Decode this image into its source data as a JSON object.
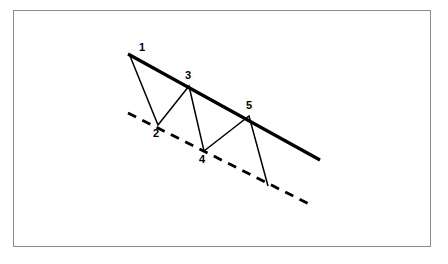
{
  "figure": {
    "background_color": "#ffffff",
    "frame": {
      "border_color": "#8c8c8c",
      "x": 13,
      "y": 10,
      "width": 418,
      "height": 237
    }
  },
  "chart_data": {
    "type": "line",
    "xlabel": "",
    "ylabel": "",
    "grid": false,
    "legend_position": "none",
    "xlim": [
      120,
      330
    ],
    "ylim": [
      210,
      40
    ],
    "annotations": [
      {
        "text": "1",
        "x": 130,
        "y": 55
      },
      {
        "text": "2",
        "x": 158,
        "y": 125
      },
      {
        "text": "3",
        "x": 189,
        "y": 86
      },
      {
        "text": "4",
        "x": 204,
        "y": 151
      },
      {
        "text": "5",
        "x": 249,
        "y": 116
      }
    ],
    "series": [
      {
        "name": "upper-trendline",
        "style": "solid",
        "color": "#000000",
        "width": 3.2,
        "points": [
          [
            128,
            54
          ],
          [
            320,
            160
          ]
        ]
      },
      {
        "name": "lower-trendline",
        "style": "dashed",
        "color": "#000000",
        "width": 2.8,
        "dash": "9 7",
        "points": [
          [
            128,
            113
          ],
          [
            311,
            205
          ]
        ]
      },
      {
        "name": "price-zigzag",
        "style": "solid",
        "color": "#000000",
        "width": 1.5,
        "points": [
          [
            130,
            56
          ],
          [
            158,
            125
          ],
          [
            189,
            86
          ],
          [
            204,
            151
          ],
          [
            249,
            116
          ],
          [
            268,
            186
          ]
        ]
      }
    ]
  },
  "labels": [
    {
      "id": "pivot-1",
      "text": "1",
      "left": 139,
      "top": 42
    },
    {
      "id": "pivot-2",
      "text": "2",
      "left": 153,
      "top": 128
    },
    {
      "id": "pivot-3",
      "text": "3",
      "left": 185,
      "top": 70
    },
    {
      "id": "pivot-4",
      "text": "4",
      "left": 199,
      "top": 154
    },
    {
      "id": "pivot-5",
      "text": "5",
      "left": 246,
      "top": 100
    }
  ]
}
